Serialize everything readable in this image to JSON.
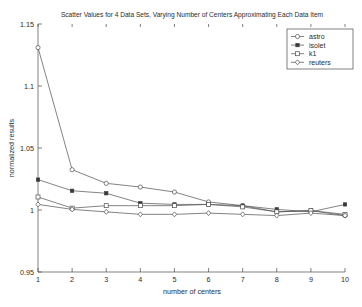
{
  "chart_data": {
    "type": "line",
    "title": "Scatter Values for 4 Data Sets, Varying Number of Centers Approximating Each Data Item",
    "xlabel": "number of centers",
    "ylabel": "normalized results",
    "x": [
      1,
      2,
      3,
      4,
      5,
      6,
      7,
      8,
      9,
      10
    ],
    "xlim": [
      1,
      10
    ],
    "ylim": [
      0.95,
      1.15
    ],
    "xticks": [
      "1",
      "2",
      "3",
      "4",
      "5",
      "6",
      "7",
      "8",
      "9",
      "10"
    ],
    "yticks": [
      "0.95",
      "1",
      "1.05",
      "1.1",
      "1.15"
    ],
    "ytick_values": [
      0.95,
      1.0,
      1.05,
      1.1,
      1.15
    ],
    "grid": false,
    "legend_position": "top-right",
    "series": [
      {
        "name": "astro",
        "marker": "circle-open",
        "values": [
          1.131,
          1.0325,
          1.0215,
          1.0185,
          1.0145,
          1.0065,
          1.0035,
          0.9985,
          0.9995,
          0.9955
        ]
      },
      {
        "name": "isolet",
        "marker": "square-filled",
        "values": [
          1.0245,
          1.0155,
          1.0135,
          1.0055,
          1.0045,
          1.0045,
          1.0035,
          1.0005,
          0.9985,
          1.0045
        ]
      },
      {
        "name": "k1",
        "marker": "square-open",
        "values": [
          1.0105,
          1.0015,
          1.0035,
          1.0035,
          1.0035,
          1.0045,
          1.0025,
          0.9985,
          0.9995,
          0.9965
        ]
      },
      {
        "name": "reuters",
        "marker": "diamond-open",
        "values": [
          1.0045,
          1.0005,
          0.9985,
          0.9965,
          0.9965,
          0.9975,
          0.9965,
          0.9955,
          0.9975,
          0.9955
        ]
      }
    ]
  },
  "legend": {
    "items": [
      {
        "label": "astro"
      },
      {
        "label": "isolet"
      },
      {
        "label": "k1"
      },
      {
        "label": "reuters"
      }
    ]
  },
  "colors": {
    "axis": "#4a4a4a",
    "line": "#4e4e4e",
    "text": "#2b2b2b",
    "background": "#ffffff"
  }
}
